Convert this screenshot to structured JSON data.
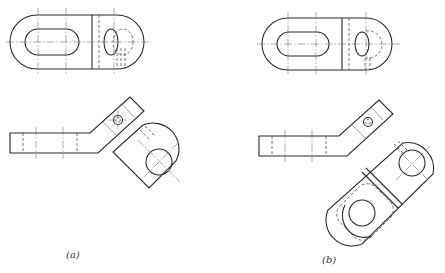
{
  "figure": {
    "type": "orthographic engineering drawing",
    "panels": [
      {
        "id": "a",
        "label": "(a)",
        "views": [
          "plan view with slot and boss",
          "elevation with bent arm",
          "auxiliary view of bent end (square end)"
        ]
      },
      {
        "id": "b",
        "label": "(b)",
        "views": [
          "plan view with slot and boss",
          "elevation with bent arm",
          "auxiliary view of bent end (full rounded link)"
        ]
      }
    ]
  },
  "colors": {
    "line": "#2a2a2a",
    "hidden": "#555555",
    "centerline": "#777777",
    "background": "#ffffff"
  }
}
